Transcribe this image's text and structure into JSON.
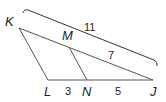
{
  "diagram": {
    "type": "triangle-with-parallel-segment",
    "colors": {
      "line": "#555555",
      "text": "#222222",
      "background": "#ffffff"
    },
    "vertices": {
      "K": {
        "label": "K",
        "x": 19,
        "y": 28
      },
      "L": {
        "label": "L",
        "x": 48,
        "y": 80
      },
      "J": {
        "label": "J",
        "x": 153,
        "y": 80
      },
      "M": {
        "label": "M",
        "x": 69,
        "y": 47
      },
      "N": {
        "label": "N",
        "x": 87,
        "y": 80
      }
    },
    "segments": [
      {
        "from": "K",
        "to": "L"
      },
      {
        "from": "K",
        "to": "J"
      },
      {
        "from": "L",
        "to": "J"
      },
      {
        "from": "M",
        "to": "N"
      }
    ],
    "measurements": {
      "KJ": "11",
      "MJ": "7",
      "LN": "3",
      "NJ": "5"
    }
  }
}
